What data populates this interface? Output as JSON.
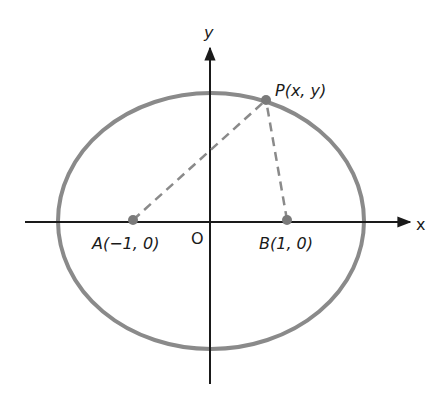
{
  "diagram": {
    "type": "ellipse-with-foci",
    "axes": {
      "x_label": "x",
      "y_label": "y",
      "origin_label": "O"
    },
    "points": {
      "A": {
        "label": "A(−1, 0)",
        "coords": [
          -1,
          0
        ]
      },
      "B": {
        "label": "B(1, 0)",
        "coords": [
          1,
          0
        ]
      },
      "P": {
        "label": "P(x, y)"
      }
    },
    "colors": {
      "ellipse": "#8a8a8a",
      "axes": "#1a1a1a",
      "dashed": "#8a8a8a",
      "points": "#7a7a7a"
    }
  }
}
